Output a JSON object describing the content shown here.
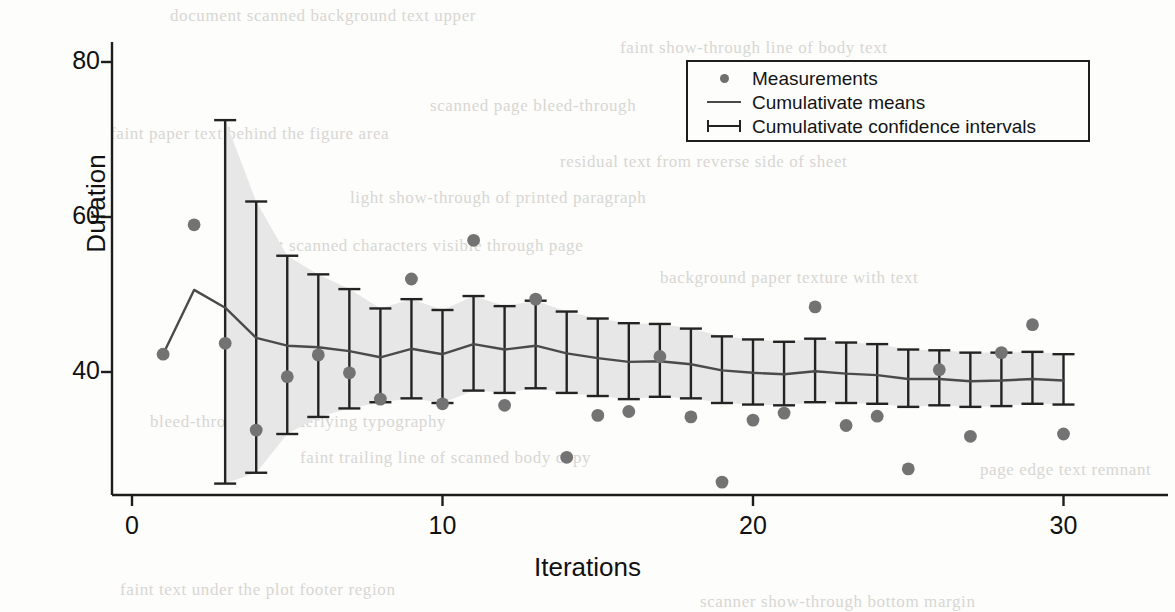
{
  "chart_data": {
    "type": "scatter",
    "title": "",
    "xlabel": "Iterations",
    "ylabel": "Duration",
    "xlim": [
      0,
      31.5
    ],
    "ylim": [
      22,
      84
    ],
    "xticks": [
      0,
      10,
      20,
      30
    ],
    "xtick_labels": [
      "0",
      "10",
      "20",
      "30"
    ],
    "yticks": [
      40,
      60,
      80
    ],
    "ytick_labels": [
      "40",
      "60",
      "80"
    ],
    "grid": false,
    "legend_position": "top-right",
    "legend": [
      {
        "key": "dot-marker",
        "label": "Measurements"
      },
      {
        "key": "line-marker",
        "label": "Cumulativate means"
      },
      {
        "key": "errorbar-marker",
        "label": "Cumulativate confidence intervals"
      }
    ],
    "x": [
      1,
      2,
      3,
      4,
      5,
      6,
      7,
      8,
      9,
      10,
      11,
      12,
      13,
      14,
      15,
      16,
      17,
      18,
      19,
      20,
      21,
      22,
      23,
      24,
      25,
      26,
      27,
      28,
      29,
      30
    ],
    "series": [
      {
        "name": "Measurements",
        "type": "scatter",
        "color": "#737373",
        "values": [
          42.3,
          59.0,
          43.7,
          32.5,
          39.4,
          42.2,
          39.9,
          36.5,
          52.0,
          35.9,
          57.0,
          35.7,
          49.4,
          29.0,
          34.4,
          34.9,
          42.0,
          34.2,
          25.8,
          33.8,
          34.7,
          48.4,
          33.1,
          34.3,
          27.5,
          40.3,
          31.7,
          42.5,
          46.1,
          32.0
        ]
      },
      {
        "name": "Cumulativate means",
        "type": "line",
        "color": "#4a4a4a",
        "values": [
          42.3,
          50.6,
          48.3,
          44.4,
          43.4,
          43.2,
          42.7,
          41.9,
          43.0,
          42.3,
          43.6,
          42.9,
          43.4,
          42.4,
          41.8,
          41.3,
          41.4,
          41.0,
          40.2,
          39.9,
          39.7,
          40.1,
          39.8,
          39.6,
          39.1,
          39.1,
          38.8,
          38.9,
          39.1,
          38.9
        ]
      }
    ],
    "errorbars": {
      "name": "Cumulativate confidence intervals",
      "color": "#232323",
      "band_color": "#e7e7e7",
      "lower": [
        null,
        null,
        25.6,
        27.0,
        32.0,
        34.2,
        35.3,
        36.1,
        36.6,
        36.0,
        37.6,
        37.3,
        37.9,
        37.3,
        36.9,
        36.5,
        36.8,
        36.6,
        36.0,
        35.8,
        35.7,
        36.1,
        36.0,
        35.9,
        35.5,
        35.7,
        35.5,
        35.6,
        35.9,
        35.8
      ],
      "upper": [
        null,
        null,
        72.5,
        62.0,
        55.0,
        52.6,
        50.7,
        48.2,
        49.4,
        48.0,
        49.8,
        48.5,
        49.2,
        47.8,
        46.9,
        46.3,
        46.2,
        45.6,
        44.6,
        44.2,
        43.9,
        44.3,
        43.8,
        43.6,
        42.9,
        42.8,
        42.5,
        42.5,
        42.6,
        42.3
      ]
    }
  },
  "background_text": [
    {
      "text": "document scanned background text upper",
      "x": 170,
      "y": 6
    },
    {
      "text": "faint show-through line of body text",
      "x": 620,
      "y": 38
    },
    {
      "text": "scanned page bleed-through",
      "x": 430,
      "y": 96
    },
    {
      "text": "faint paper text behind the figure area",
      "x": 110,
      "y": 124
    },
    {
      "text": "residual text from reverse side of sheet",
      "x": 560,
      "y": 152
    },
    {
      "text": "light show-through of printed paragraph",
      "x": 350,
      "y": 188
    },
    {
      "text": "faint scanned characters visible through page",
      "x": 250,
      "y": 236
    },
    {
      "text": "background paper texture with text",
      "x": 660,
      "y": 268
    },
    {
      "text": "bleed-through of underlying typography",
      "x": 150,
      "y": 412
    },
    {
      "text": "faint trailing line of scanned body copy",
      "x": 300,
      "y": 448
    },
    {
      "text": "page edge text remnant",
      "x": 980,
      "y": 460
    },
    {
      "text": "faint text under the plot footer region",
      "x": 120,
      "y": 580
    },
    {
      "text": "scanner show-through bottom margin",
      "x": 700,
      "y": 592
    }
  ]
}
